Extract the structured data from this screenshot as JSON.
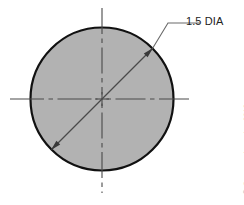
{
  "drawing": {
    "title": "Circle with diameter dimension",
    "dimension_label": "1.5 DIA",
    "copyright": "© Cengage Learning 2013",
    "colors": {
      "fill": "#b2b2b2",
      "outline": "#111111",
      "centerline": "#4a4a4a",
      "leader": "#4a4a4a",
      "text": "#222222",
      "copyright_text": "#8a8a8a",
      "background": "#ffffff"
    },
    "geometry": {
      "circle": {
        "cx": 102,
        "cy": 99,
        "r": 71.5,
        "stroke_width": 2.2
      },
      "vertical_centerline": {
        "x": 102,
        "y1": 8,
        "y2": 193
      },
      "horizontal_centerline": {
        "y": 99,
        "x1": 10,
        "x2": 192
      },
      "center_mark_size": 7,
      "diameter_line": {
        "x1": 51.5,
        "y1": 149.5,
        "x2": 152.5,
        "y2": 48.5,
        "angle_deg": 45
      },
      "leader_shoulder": {
        "x1": 152.5,
        "y1": 48.5,
        "x2": 168,
        "y2": 23,
        "x3": 200,
        "y3": 23
      }
    }
  }
}
